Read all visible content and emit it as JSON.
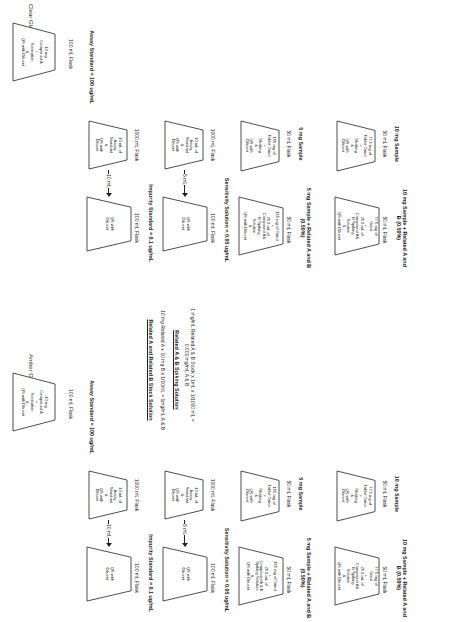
{
  "sections": {
    "clear": {
      "title": "Clear Glassware",
      "stock_flask": {
        "text": "10 mg\nCompound A\n+\nSonication\n&\nQS with Diluent",
        "label": "100 mL Flask"
      },
      "assay_label": "Assay Standard = 100 ug/mL",
      "row1": {
        "left_flask": {
          "text": "10 mL of\nAssay\nStandard\n&\nQS with\nDiluent",
          "label": "1000 mL Flask"
        },
        "arrow": "10 mL",
        "right_flask": {
          "text": "QS with\nDiluent",
          "label": "100 mL Flask"
        },
        "result": "Impurity Standard = 0.1 ug/mL"
      },
      "row2": {
        "left_flask": {
          "text": "10 mL of\nAssay\nStandard\n&\nQS with\nDiluent",
          "label": "1000 mL Flask"
        },
        "arrow": "5 mL",
        "right_flask": {
          "text": "QS with\nDiluent",
          "label": "100 mL Flask"
        },
        "result": "Sensitivity Solution = 0.05 ug/mL"
      },
      "row3": {
        "left_flask": {
          "text": "155 mg of\nTablet Grind\n+\nShaking\n&\nQS with\nDiluent",
          "label": "50 mL Flask",
          "result": "5 mg Sample"
        },
        "right_flask": {
          "text": "155 mg of Grind\n+\n25.0 mL of\nCompound A&\nB Spiking\nSolution\n&\nQS with Diluent",
          "label": "50 mL Flask",
          "result": "5 mg Sample + Related A and B\n(0.50%)"
        }
      },
      "row4": {
        "left_flask": {
          "text": "77.5 mg of\nTablet Grind\n+\nShaking\n&\nQS with\nDiluent",
          "label": "50 mL Flask",
          "result": "10 mg Sample"
        },
        "right_flask": {
          "text": "77.5 mg of\nGrind\n+\n25.0 mL of\nCompound A&\nB Spiking\nSolution\n&\nQS with Diluent",
          "label": "50 mL Flask",
          "result": "10 mg Sample + Related A and\nB (0.50%)"
        }
      }
    },
    "amber": {
      "title": "Amber Glassware",
      "stock_flask": {
        "text": "10 mg\nCompound A\n+\nSonication\n&\nQS with Diluent",
        "label": "100 mL Flask"
      },
      "assay_label": "Assay Standard = 100 ug/mL",
      "row1": {
        "left_flask": {
          "text": "10 mL of\nAssay\nStandard\n&\nQS with\nDiluent",
          "label": "1000 mL Flask"
        },
        "arrow": "10 mL",
        "right_flask": {
          "text": "QS with\nDiluent",
          "label": "100 mL Flask"
        },
        "result": "Impurity Standard = 0.1 ug/mL"
      },
      "row2": {
        "left_flask": {
          "text": "10 mL of\nAssay\nStandard\n&\nQS with\nDiluent",
          "label": "1000 mL Flask"
        },
        "arrow": "5 mL",
        "right_flask": {
          "text": "QS with\nDiluent",
          "label": "100 mL Flask"
        },
        "result": "Sensitivity Solution = 0.05 ug/mL"
      },
      "row3": {
        "left_flask": {
          "text": "155 mg of\nTablet Grind\n+\nShaking\n&\nQS with\nDiluent",
          "label": "50 mL Flask",
          "result": "5 mg Sample"
        },
        "right_flask": {
          "text": "155 mg of Grind\n+\n25.0 mL of\nCompound A & B\nSpiking Solution\n&\nQS with Diluent",
          "label": "50 mL Flask",
          "result": "5 mg Sample + Related A and B\n(0.50%)"
        }
      },
      "row4": {
        "left_flask": {
          "text": "77.5 mg of\nTablet Grind\n+\nShaking\n&\nQS with\nDiluent",
          "label": "50 mL Flask",
          "result": "10 mg Sample"
        },
        "right_flask": {
          "text": "77.5 mg of\nGrind\n+\n25.0 mL of\nCompound A&\nB Spiking\nSolution\n&\nQS with Diluent",
          "label": "50 mL Flask",
          "result": "10 mg Sample + Related A and\nB (0.50%)"
        }
      }
    }
  },
  "middle": {
    "stock_title": "Related A and Related B Stock Solution",
    "stock_formula": "10 mg Related A + 10 mg B x 1/10mL = 1mg/mL A & B",
    "spiking_title": "Related A & B Spiking Solution",
    "spiking_formula": "1 mg/mL Related A & B Stock x 1mL x 1/1000 mL =\n0.001 mg/mL A & B"
  }
}
